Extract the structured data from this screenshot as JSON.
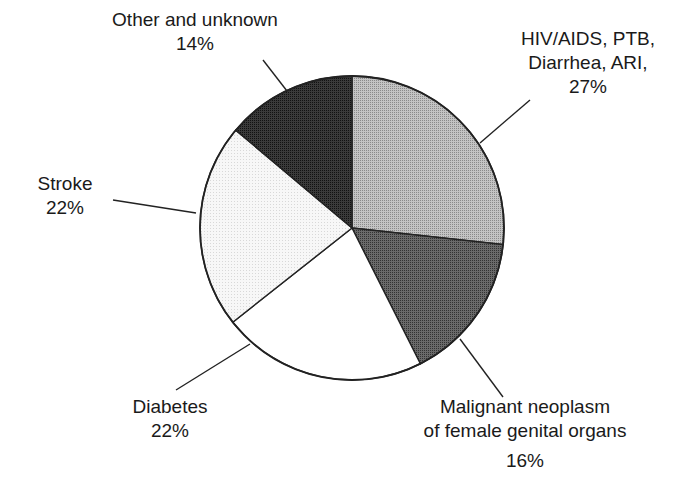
{
  "chart_data": {
    "type": "pie",
    "title": "",
    "categories": [
      "HIV/AIDS, PTB, Diarrhea, ARI",
      "Malignant neoplasm of female genital organs",
      "Diabetes",
      "Stroke",
      "Other and unknown"
    ],
    "values": [
      27,
      16,
      22,
      22,
      14
    ],
    "unit": "%",
    "start_angle_deg": -90,
    "direction": "clockwise",
    "legend": "none (direct labels with leader lines)",
    "slices": [
      {
        "name": "HIV/AIDS, PTB, Diarrhea, ARI",
        "value": 27,
        "fill": "#b4b4b4"
      },
      {
        "name": "Malignant neoplasm of female genital organs",
        "value": 16,
        "fill": "#5a5a5a"
      },
      {
        "name": "Diabetes",
        "value": 22,
        "fill": "#ffffff"
      },
      {
        "name": "Stroke",
        "value": 22,
        "fill": "#f2f2f2"
      },
      {
        "name": "Other and unknown",
        "value": 14,
        "fill": "#2a2a2a"
      }
    ]
  },
  "labels": {
    "hiv": {
      "line1": "HIV/AIDS, PTB,",
      "line2": "Diarrhea, ARI,",
      "line3": "27%"
    },
    "malignant": {
      "line1": "Malignant neoplasm",
      "line2": "of female genital organs",
      "line3": "16%"
    },
    "diabetes": {
      "line1": "Diabetes",
      "line2": "22%"
    },
    "stroke": {
      "line1": "Stroke",
      "line2": "22%"
    },
    "other": {
      "line1": "Other and unknown",
      "line2": "14%"
    }
  }
}
